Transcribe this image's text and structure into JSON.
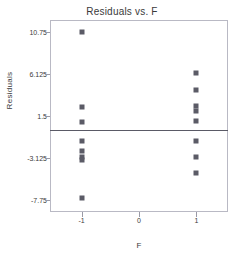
{
  "chart_data": {
    "type": "scatter",
    "title": "Residuals vs. F",
    "xlabel": "F",
    "ylabel": "Residuals",
    "xlim": [
      -1.55,
      1.55
    ],
    "ylim": [
      -9.1,
      12.1
    ],
    "grid": false,
    "legend": null,
    "xticks": [
      "-1",
      "0",
      "1"
    ],
    "xtick_values": [
      -1,
      0,
      1
    ],
    "yticks": [
      "10.75",
      "6.125",
      "1.5",
      "-3.125",
      "-7.75"
    ],
    "ytick_values": [
      10.75,
      6.125,
      1.5,
      -3.125,
      -7.75
    ],
    "reference_line": {
      "orientation": "horizontal",
      "value": 0
    },
    "marker": {
      "shape": "square",
      "color": "#5b5b66",
      "size": 5
    },
    "series": [
      {
        "name": "Residuals",
        "points": [
          {
            "x": -1,
            "y": 10.75
          },
          {
            "x": -1,
            "y": 2.5
          },
          {
            "x": -1,
            "y": 0.85
          },
          {
            "x": -1,
            "y": -1.3
          },
          {
            "x": -1,
            "y": -2.4
          },
          {
            "x": -1,
            "y": -3.0
          },
          {
            "x": -1,
            "y": -3.4
          },
          {
            "x": -1,
            "y": -7.6
          },
          {
            "x": 1,
            "y": 6.2
          },
          {
            "x": 1,
            "y": 4.4
          },
          {
            "x": 1,
            "y": 2.6
          },
          {
            "x": 1,
            "y": 2.1
          },
          {
            "x": 1,
            "y": 1.0
          },
          {
            "x": 1,
            "y": -1.3
          },
          {
            "x": 1,
            "y": -3.0
          },
          {
            "x": 1,
            "y": -4.8
          }
        ]
      }
    ]
  },
  "colors": {
    "marker": "#5b5b66",
    "frame": "#b9b9c4",
    "reference_line": "#5a5a66",
    "text": "#3a3a3a",
    "background": "#ffffff"
  }
}
